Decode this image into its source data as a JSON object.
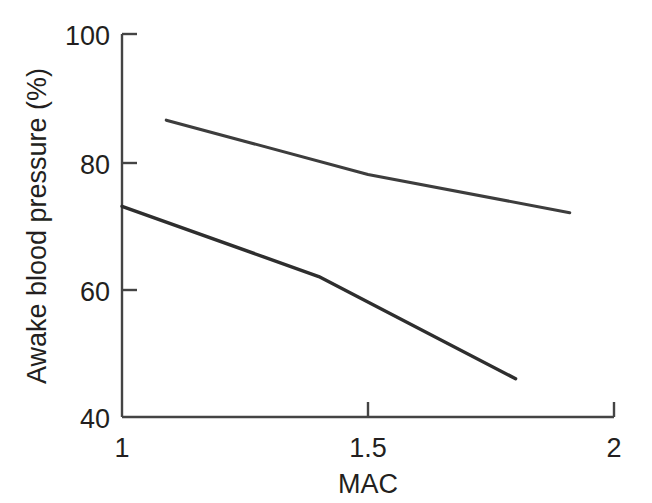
{
  "chart_data": {
    "type": "line",
    "title": "",
    "subtitle": "",
    "xlabel": "MAC",
    "ylabel": "Awake blood pressure (%)",
    "xlim": [
      1,
      2
    ],
    "ylim": [
      40,
      100
    ],
    "xticks": [
      1,
      1.5,
      2
    ],
    "xtick_labels": [
      "1",
      "1.5",
      "2"
    ],
    "yticks": [
      40,
      60,
      80,
      100
    ],
    "ytick_labels": [
      "40",
      "60",
      "80",
      "100"
    ],
    "grid": false,
    "legend": false,
    "legend_position": "none",
    "annotations": [],
    "series": [
      {
        "name": "upper-line",
        "color": "#3d3d3d",
        "x": [
          1.09,
          1.5,
          1.91
        ],
        "y": [
          86.5,
          78,
          72
        ]
      },
      {
        "name": "lower-line",
        "color": "#2e2e2e",
        "x": [
          1.0,
          1.4,
          1.8
        ],
        "y": [
          73,
          62,
          46
        ]
      }
    ]
  },
  "axes": {
    "x_axis_label": "MAC",
    "y_axis_label": "Awake blood pressure (%)",
    "x_tick_labels": [
      "1",
      "1.5",
      "2"
    ],
    "y_tick_labels": [
      "100",
      "80",
      "60",
      "40"
    ]
  },
  "colors": {
    "background": "#ffffff",
    "axis": "#444444",
    "text": "#231f20",
    "series_upper": "#3d3d3d",
    "series_lower": "#2e2e2e"
  }
}
